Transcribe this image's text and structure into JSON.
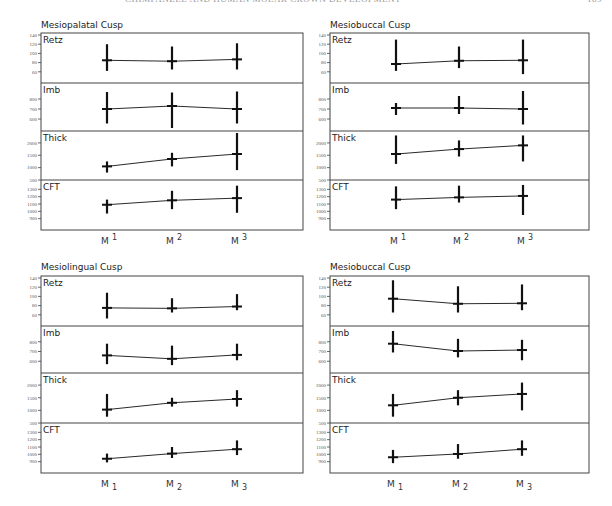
{
  "running_head": {
    "title": "CHIMPANZEE AND HUMAN MOLAR CROWN DEVELOPMENT",
    "page": "189"
  },
  "chart_data": [
    {
      "type": "line",
      "title": "Mesiopalatal Cusp",
      "categories": [
        "M1",
        "M2",
        "M3"
      ],
      "tooth_notation": "superscript",
      "x_labels": [
        {
          "base": "M",
          "index": "1"
        },
        {
          "base": "M",
          "index": "2"
        },
        {
          "base": "M",
          "index": "3"
        }
      ],
      "rows": [
        {
          "name": "Retz",
          "ylim": [
            40,
            140
          ],
          "ticks": [
            60,
            80,
            100,
            120,
            140
          ],
          "mean": [
            85,
            83,
            87
          ],
          "err_low": [
            62,
            65,
            65
          ],
          "err_high": [
            120,
            115,
            122
          ]
        },
        {
          "name": "Imb",
          "ylim": [
            500,
            900
          ],
          "ticks": [
            600,
            700,
            800
          ],
          "mean": [
            700,
            730,
            700
          ],
          "err_low": [
            555,
            510,
            555
          ],
          "err_high": [
            870,
            865,
            875
          ]
        },
        {
          "name": "Thick",
          "ylim": [
            500,
            2400
          ],
          "ticks": [
            500,
            1000,
            1500,
            2000
          ],
          "mean": [
            1050,
            1350,
            1550
          ],
          "err_low": [
            800,
            1050,
            900
          ],
          "err_high": [
            1250,
            1600,
            2400
          ]
        },
        {
          "name": "CFT",
          "ylim": [
            800,
            1400
          ],
          "ticks": [
            900,
            1000,
            1100,
            1200,
            1300
          ],
          "mean": [
            1090,
            1150,
            1180
          ],
          "err_low": [
            970,
            1030,
            980
          ],
          "err_high": [
            1160,
            1280,
            1350
          ]
        }
      ]
    },
    {
      "type": "line",
      "title": "Mesiobuccal Cusp",
      "categories": [
        "M1",
        "M2",
        "M3"
      ],
      "tooth_notation": "superscript",
      "x_labels": [
        {
          "base": "M",
          "index": "1"
        },
        {
          "base": "M",
          "index": "2"
        },
        {
          "base": "M",
          "index": "3"
        }
      ],
      "rows": [
        {
          "name": "Retz",
          "ylim": [
            40,
            140
          ],
          "ticks": [
            60,
            80,
            100,
            120,
            140
          ],
          "mean": [
            77,
            84,
            85
          ],
          "err_low": [
            62,
            68,
            55
          ],
          "err_high": [
            130,
            115,
            130
          ]
        },
        {
          "name": "Imb",
          "ylim": [
            500,
            900
          ],
          "ticks": [
            600,
            700,
            800
          ],
          "mean": [
            710,
            710,
            700
          ],
          "err_low": [
            640,
            650,
            545
          ],
          "err_high": [
            760,
            830,
            880
          ]
        },
        {
          "name": "Thick",
          "ylim": [
            500,
            2400
          ],
          "ticks": [
            500,
            1000,
            1500,
            2000
          ],
          "mean": [
            1550,
            1750,
            1900
          ],
          "err_low": [
            1150,
            1450,
            1250
          ],
          "err_high": [
            2300,
            2100,
            2300
          ]
        },
        {
          "name": "CFT",
          "ylim": [
            800,
            1400
          ],
          "ticks": [
            900,
            1000,
            1100,
            1200,
            1300
          ],
          "mean": [
            1160,
            1190,
            1210
          ],
          "err_low": [
            1030,
            1120,
            950
          ],
          "err_high": [
            1340,
            1350,
            1360
          ]
        }
      ]
    },
    {
      "type": "line",
      "title": "Mesiolingual Cusp",
      "categories": [
        "M1",
        "M2",
        "M3"
      ],
      "tooth_notation": "subscript",
      "x_labels": [
        {
          "base": "M",
          "index": "1"
        },
        {
          "base": "M",
          "index": "2"
        },
        {
          "base": "M",
          "index": "3"
        }
      ],
      "rows": [
        {
          "name": "Retz",
          "ylim": [
            40,
            140
          ],
          "ticks": [
            60,
            80,
            100,
            120,
            140
          ],
          "mean": [
            75,
            74,
            78
          ],
          "err_low": [
            52,
            65,
            70
          ],
          "err_high": [
            108,
            96,
            105
          ]
        },
        {
          "name": "Imb",
          "ylim": [
            500,
            900
          ],
          "ticks": [
            600,
            700,
            800
          ],
          "mean": [
            660,
            625,
            665
          ],
          "err_low": [
            570,
            560,
            610
          ],
          "err_high": [
            780,
            760,
            780
          ]
        },
        {
          "name": "Thick",
          "ylim": [
            500,
            2400
          ],
          "ticks": [
            500,
            1000,
            1500,
            2000
          ],
          "mean": [
            1030,
            1300,
            1450
          ],
          "err_low": [
            750,
            1150,
            1150
          ],
          "err_high": [
            1650,
            1500,
            1800
          ]
        },
        {
          "name": "CFT",
          "ylim": [
            800,
            1400
          ],
          "ticks": [
            900,
            1000,
            1100,
            1200,
            1300
          ],
          "mean": [
            940,
            1010,
            1070
          ],
          "err_low": [
            890,
            950,
            990
          ],
          "err_high": [
            1010,
            1100,
            1190
          ]
        }
      ]
    },
    {
      "type": "line",
      "title": "Mesiobuccal Cusp",
      "categories": [
        "M1",
        "M2",
        "M3"
      ],
      "tooth_notation": "subscript",
      "x_labels": [
        {
          "base": "M",
          "index": "1"
        },
        {
          "base": "M",
          "index": "2"
        },
        {
          "base": "M",
          "index": "3"
        }
      ],
      "rows": [
        {
          "name": "Retz",
          "ylim": [
            40,
            140
          ],
          "ticks": [
            60,
            80,
            100,
            120,
            140
          ],
          "mean": [
            95,
            84,
            85
          ],
          "err_low": [
            65,
            65,
            70
          ],
          "err_high": [
            135,
            122,
            126
          ]
        },
        {
          "name": "Imb",
          "ylim": [
            500,
            900
          ],
          "ticks": [
            600,
            700,
            800
          ],
          "mean": [
            780,
            705,
            715
          ],
          "err_low": [
            690,
            640,
            610
          ],
          "err_high": [
            910,
            830,
            820
          ]
        },
        {
          "name": "Thick",
          "ylim": [
            500,
            2400
          ],
          "ticks": [
            500,
            1000,
            1500,
            2000
          ],
          "mean": [
            1200,
            1500,
            1650
          ],
          "err_low": [
            750,
            1200,
            1000
          ],
          "err_high": [
            1650,
            1800,
            2100
          ]
        },
        {
          "name": "CFT",
          "ylim": [
            800,
            1400
          ],
          "ticks": [
            900,
            1000,
            1100,
            1200,
            1300
          ],
          "mean": [
            960,
            1005,
            1070
          ],
          "err_low": [
            880,
            940,
            980
          ],
          "err_high": [
            1060,
            1140,
            1190
          ]
        }
      ]
    }
  ]
}
